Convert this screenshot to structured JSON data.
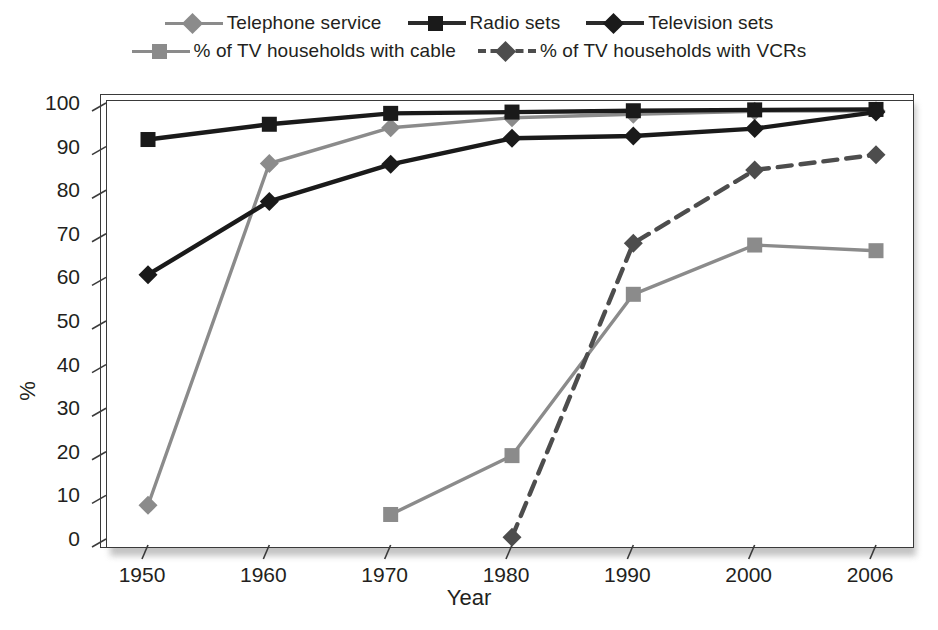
{
  "chart_data": {
    "type": "line",
    "title": "",
    "xlabel": "Year",
    "ylabel": "%",
    "x": [
      1950,
      1960,
      1970,
      1980,
      1990,
      2000,
      2006
    ],
    "categories": [
      "1950",
      "1960",
      "1970",
      "1980",
      "1990",
      "2000",
      "2006"
    ],
    "ylim": [
      0,
      100
    ],
    "yticks": [
      0,
      10,
      20,
      30,
      40,
      50,
      60,
      70,
      80,
      90,
      100
    ],
    "ytick_labels": [
      "0",
      "10",
      "20",
      "30",
      "40",
      "50",
      "60",
      "70",
      "80",
      "90",
      "100"
    ],
    "grid": false,
    "legend_position": "top",
    "series": [
      {
        "name": "Telephone service",
        "marker": "diamond",
        "color": "#8b8b8b",
        "line_style": "solid",
        "values": [
          9.1,
          87.5,
          95.7,
          98.0,
          98.8,
          99.5,
          99.6
        ]
      },
      {
        "name": "Radio sets",
        "marker": "square",
        "color": "#1a1a1a",
        "line_style": "solid",
        "values": [
          93.0,
          96.5,
          99.0,
          99.3,
          99.6,
          99.8,
          99.9
        ]
      },
      {
        "name": "Television sets",
        "marker": "diamond",
        "color": "#1a1a1a",
        "line_style": "solid",
        "values": [
          62.0,
          78.8,
          87.3,
          93.3,
          93.8,
          95.5,
          99.3
        ]
      },
      {
        "name": "% of TV households with cable",
        "marker": "square",
        "color": "#8b8b8b",
        "line_style": "solid",
        "values": [
          null,
          null,
          7.0,
          20.5,
          57.5,
          68.8,
          67.5
        ]
      },
      {
        "name": "% of TV households with VCRs",
        "marker": "diamond",
        "color": "#4d4d4d",
        "line_style": "dashed",
        "values": [
          null,
          null,
          null,
          1.8,
          69.2,
          86.0,
          89.5
        ]
      }
    ]
  },
  "legend": {
    "rows": [
      [
        {
          "label": "Telephone service",
          "line_class": "solid-gray",
          "mark_class": "diamond-gray"
        },
        {
          "label": "Radio sets",
          "line_class": "solid-black",
          "mark_class": "square-black"
        },
        {
          "label": "Television sets",
          "line_class": "solid-black",
          "mark_class": "diamond-black"
        }
      ],
      [
        {
          "label": "% of TV households with cable",
          "line_class": "solid-gray",
          "mark_class": "square-gray"
        },
        {
          "label": "% of TV households with VCRs",
          "line_class": "dashed-dark",
          "mark_class": "diamond-dark"
        }
      ]
    ]
  },
  "axes": {
    "x_title": "Year",
    "y_title": "%"
  }
}
